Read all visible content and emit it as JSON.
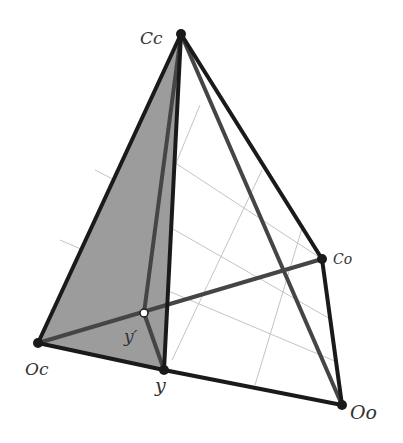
{
  "figure": {
    "type": "tetrahedron-diagram",
    "colors": {
      "edge": "#1a1a1a",
      "inner_edge": "#444444",
      "grid": "#bdbdbd",
      "shade": "#9a9a9a",
      "highlight_point": "#ffffff"
    },
    "vertices": {
      "Cc": {
        "label": "Cc",
        "x": 181,
        "y": 34
      },
      "Oc": {
        "label": "Oc",
        "x": 38,
        "y": 343
      },
      "y": {
        "label": "y",
        "x": 164,
        "y": 370
      },
      "Co": {
        "label": "Co",
        "x": 322,
        "y": 259
      },
      "Oo": {
        "label": "Oo",
        "x": 342,
        "y": 405
      },
      "y_prime": {
        "label": "y′",
        "x": 144,
        "y": 313
      }
    },
    "labels": {
      "Cc": "Cc",
      "Oc": "Oc",
      "y": "y",
      "Co": "Co",
      "Oo": "Oo",
      "y_prime": "y′"
    }
  }
}
